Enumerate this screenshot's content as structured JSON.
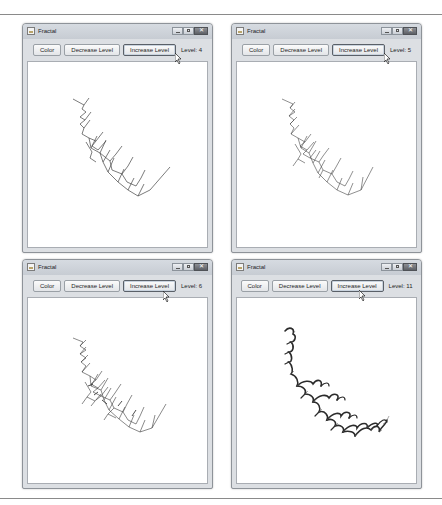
{
  "windows": [
    {
      "title": "Fractal",
      "buttons": {
        "color": "Color",
        "decrease": "Decrease Level",
        "increase": "Increase Level"
      },
      "level_text": "Level: 4",
      "level": 4
    },
    {
      "title": "Fractal",
      "buttons": {
        "color": "Color",
        "decrease": "Decrease Level",
        "increase": "Increase Level"
      },
      "level_text": "Level: 5",
      "level": 5
    },
    {
      "title": "Fractal",
      "buttons": {
        "color": "Color",
        "decrease": "Decrease Level",
        "increase": "Increase Level"
      },
      "level_text": "Level: 6",
      "level": 6
    },
    {
      "title": "Fractal",
      "buttons": {
        "color": "Color",
        "decrease": "Decrease Level",
        "increase": "Increase Level"
      },
      "level_text": "Level: 11",
      "level": 11
    }
  ],
  "icons": {
    "app": "java-cup-icon",
    "minimize": "minimize-icon",
    "maximize": "maximize-icon",
    "close": "close-icon",
    "cursor": "mouse-pointer-icon"
  },
  "colors": {
    "frame": "#dcdfe3",
    "canvas": "#ffffff",
    "fractal_stroke": "#333333"
  }
}
